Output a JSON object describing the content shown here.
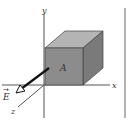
{
  "diagram": {
    "axes": {
      "x_label": "x",
      "y_label": "y",
      "z_label": "z"
    },
    "cube": {
      "face_label": "A",
      "front_color": "#8c8c8c",
      "top_color": "#b4b4b4",
      "side_color": "#787878"
    },
    "field": {
      "label": "E",
      "vector_arrow": "→"
    },
    "colors": {
      "axis": "#555555",
      "arrow": "#111111",
      "border": "#666666"
    }
  }
}
